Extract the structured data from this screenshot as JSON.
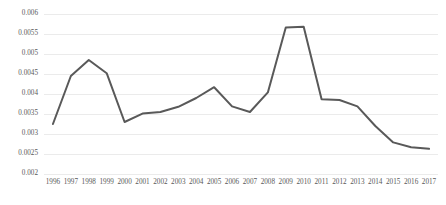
{
  "chart_data": {
    "type": "line",
    "title": "",
    "subtitle": "",
    "xlabel": "",
    "ylabel": "",
    "grid": true,
    "legend": false,
    "legend_position": "none",
    "xlim": [
      1996,
      2017
    ],
    "ylim": [
      0.002,
      0.006
    ],
    "y_ticks": [
      0.002,
      0.0025,
      0.003,
      0.0035,
      0.004,
      0.0045,
      0.005,
      0.0055,
      0.006
    ],
    "y_tick_labels": [
      "0.002",
      "0.0025",
      "0.003",
      "0.0035",
      "0.004",
      "0.0045",
      "0.005",
      "0.0055",
      "0.006"
    ],
    "categories": [
      1996,
      1997,
      1998,
      1999,
      2000,
      2001,
      2002,
      2003,
      2004,
      2005,
      2006,
      2007,
      2008,
      2009,
      2010,
      2011,
      2012,
      2013,
      2014,
      2015,
      2016,
      2017
    ],
    "x_tick_labels": [
      "1996",
      "1997",
      "1998",
      "1999",
      "2000",
      "2001",
      "2002",
      "2003",
      "2004",
      "2005",
      "2006",
      "2007",
      "2008",
      "2009",
      "2010",
      "2011",
      "2012",
      "2013",
      "2014",
      "2015",
      "2016",
      "2017"
    ],
    "series": [
      {
        "name": "series-1",
        "color": "#595959",
        "line_width": 2,
        "markers": false,
        "values": [
          0.00325,
          0.00445,
          0.00485,
          0.00452,
          0.0033,
          0.00351,
          0.00355,
          0.00368,
          0.0039,
          0.00417,
          0.00369,
          0.00355,
          0.00404,
          0.00566,
          0.00568,
          0.00387,
          0.00385,
          0.00369,
          0.0032,
          0.00279,
          0.00267,
          0.00263
        ]
      }
    ]
  }
}
